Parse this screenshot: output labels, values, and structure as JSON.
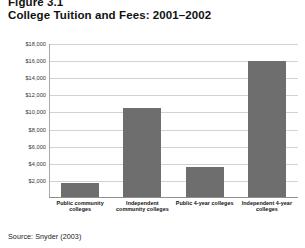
{
  "figure": {
    "number": "Figure 3.1",
    "title": "College Tuition and Fees: 2001–2002",
    "source": "Source: Snyder (2003)"
  },
  "chart_data": {
    "type": "bar",
    "title": "College Tuition and Fees: 2001–2002",
    "xlabel": "",
    "ylabel": "",
    "ylim": [
      0,
      18000
    ],
    "grid": true,
    "legend": false,
    "bar_color": "#6e6e6e",
    "gridline_color": "#d2d2d2",
    "categories": [
      "Public community colleges",
      "Independent community colleges",
      "Public 4-year colleges",
      "Independent 4-year colleges"
    ],
    "values": [
      1700,
      10500,
      3600,
      16000
    ],
    "yticks": [
      2000,
      4000,
      6000,
      8000,
      10000,
      12000,
      14000,
      16000,
      18000
    ],
    "ytick_labels": [
      "$2,000",
      "$4,000",
      "$6,000",
      "$8,000",
      "$10,000",
      "$12,000",
      "$14,000",
      "$16,000",
      "$18,000"
    ]
  }
}
